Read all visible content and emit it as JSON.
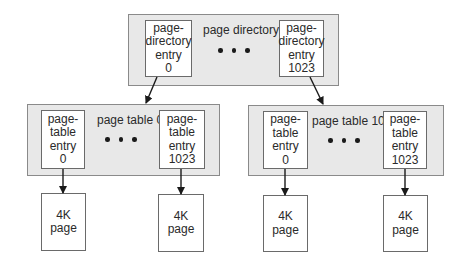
{
  "diagram": {
    "type": "two-level page table hierarchy",
    "page_directory": {
      "title": "page directory",
      "first_entry": [
        "page-",
        "directory",
        "entry",
        "0"
      ],
      "last_entry": [
        "page-",
        "directory",
        "entry",
        "1023"
      ],
      "ellipsis": "• • •"
    },
    "page_tables": [
      {
        "title": "page table 0",
        "first_entry": [
          "page-",
          "table",
          "entry",
          "0"
        ],
        "last_entry": [
          "page-",
          "table",
          "entry",
          "1023"
        ],
        "pages": [
          [
            "4K",
            "page"
          ],
          [
            "4K",
            "page"
          ]
        ]
      },
      {
        "title": "page table 1023",
        "first_entry": [
          "page-",
          "table",
          "entry",
          "0"
        ],
        "last_entry": [
          "page-",
          "table",
          "entry",
          "1023"
        ],
        "pages": [
          [
            "4K",
            "page"
          ],
          [
            "4K",
            "page"
          ]
        ]
      }
    ],
    "edges": [
      {
        "from": "page-directory-entry-0",
        "to": "page-table-0"
      },
      {
        "from": "page-directory-entry-1023",
        "to": "page-table-1023"
      },
      {
        "from": "page-table-0-entry-0",
        "to": "page-table-0-page-a"
      },
      {
        "from": "page-table-0-entry-1023",
        "to": "page-table-0-page-b"
      },
      {
        "from": "page-table-1023-entry-0",
        "to": "page-table-1023-page-a"
      },
      {
        "from": "page-table-1023-entry-1023",
        "to": "page-table-1023-page-b"
      }
    ],
    "colors": {
      "group_fill": "#e8e8e8",
      "group_border": "#8a8a8a",
      "box_fill": "#ffffff",
      "box_border": "#6a6a6a",
      "arrow": "#1a1a1a"
    }
  }
}
